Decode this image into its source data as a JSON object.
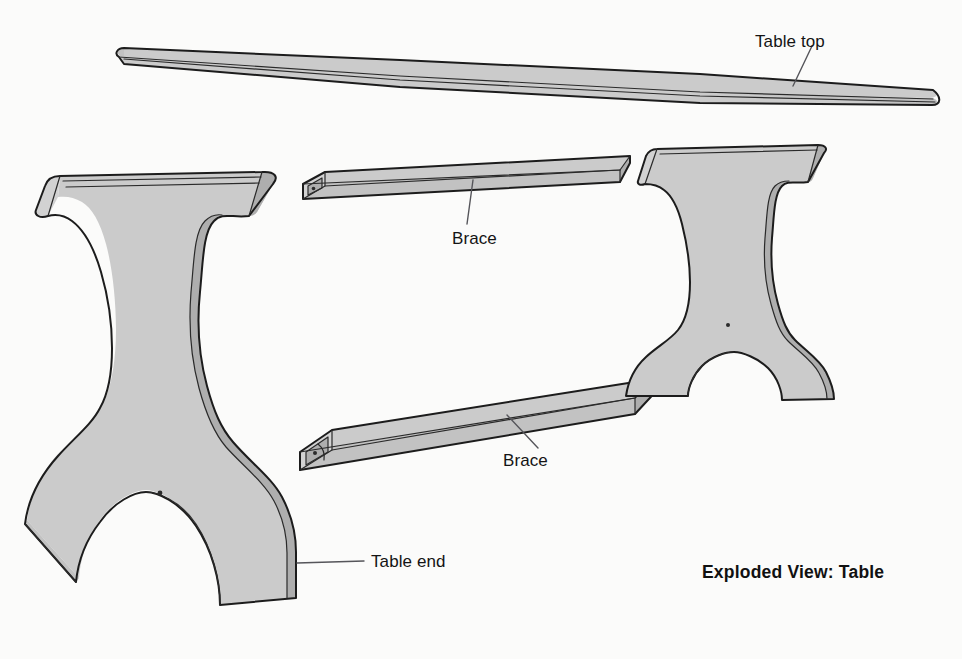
{
  "figure": {
    "title": "Exploded View: Table",
    "background_color": "#fbfbfa",
    "part_fill_color": "#cccccc",
    "part_shade_color": "#b9b9b9",
    "outline_color": "#1c1c1c",
    "label_color": "#141414"
  },
  "labels": {
    "table_top": "Table top",
    "brace_upper": "Brace",
    "brace_lower": "Brace",
    "table_end": "Table end"
  },
  "parts": [
    {
      "id": "table-top",
      "name": "Table top",
      "label": "Table top",
      "quantity": 1,
      "description": "Long flat slab shown in steep perspective, rounded ends"
    },
    {
      "id": "brace-upper",
      "name": "Brace",
      "label": "Brace",
      "quantity": 1,
      "description": "Rectangular stretcher bar with mortised end face"
    },
    {
      "id": "brace-lower",
      "name": "Brace",
      "label": "Brace",
      "quantity": 1,
      "description": "Rectangular stretcher bar with mortised end face"
    },
    {
      "id": "table-end-left",
      "name": "Table end",
      "label": "Table end",
      "quantity": 1,
      "description": "Shaped trestle end with waisted profile, flared foot and arched cutout"
    },
    {
      "id": "table-end-right",
      "name": "Table end",
      "label": "",
      "quantity": 1,
      "description": "Shaped trestle end, far side of assembly"
    }
  ]
}
